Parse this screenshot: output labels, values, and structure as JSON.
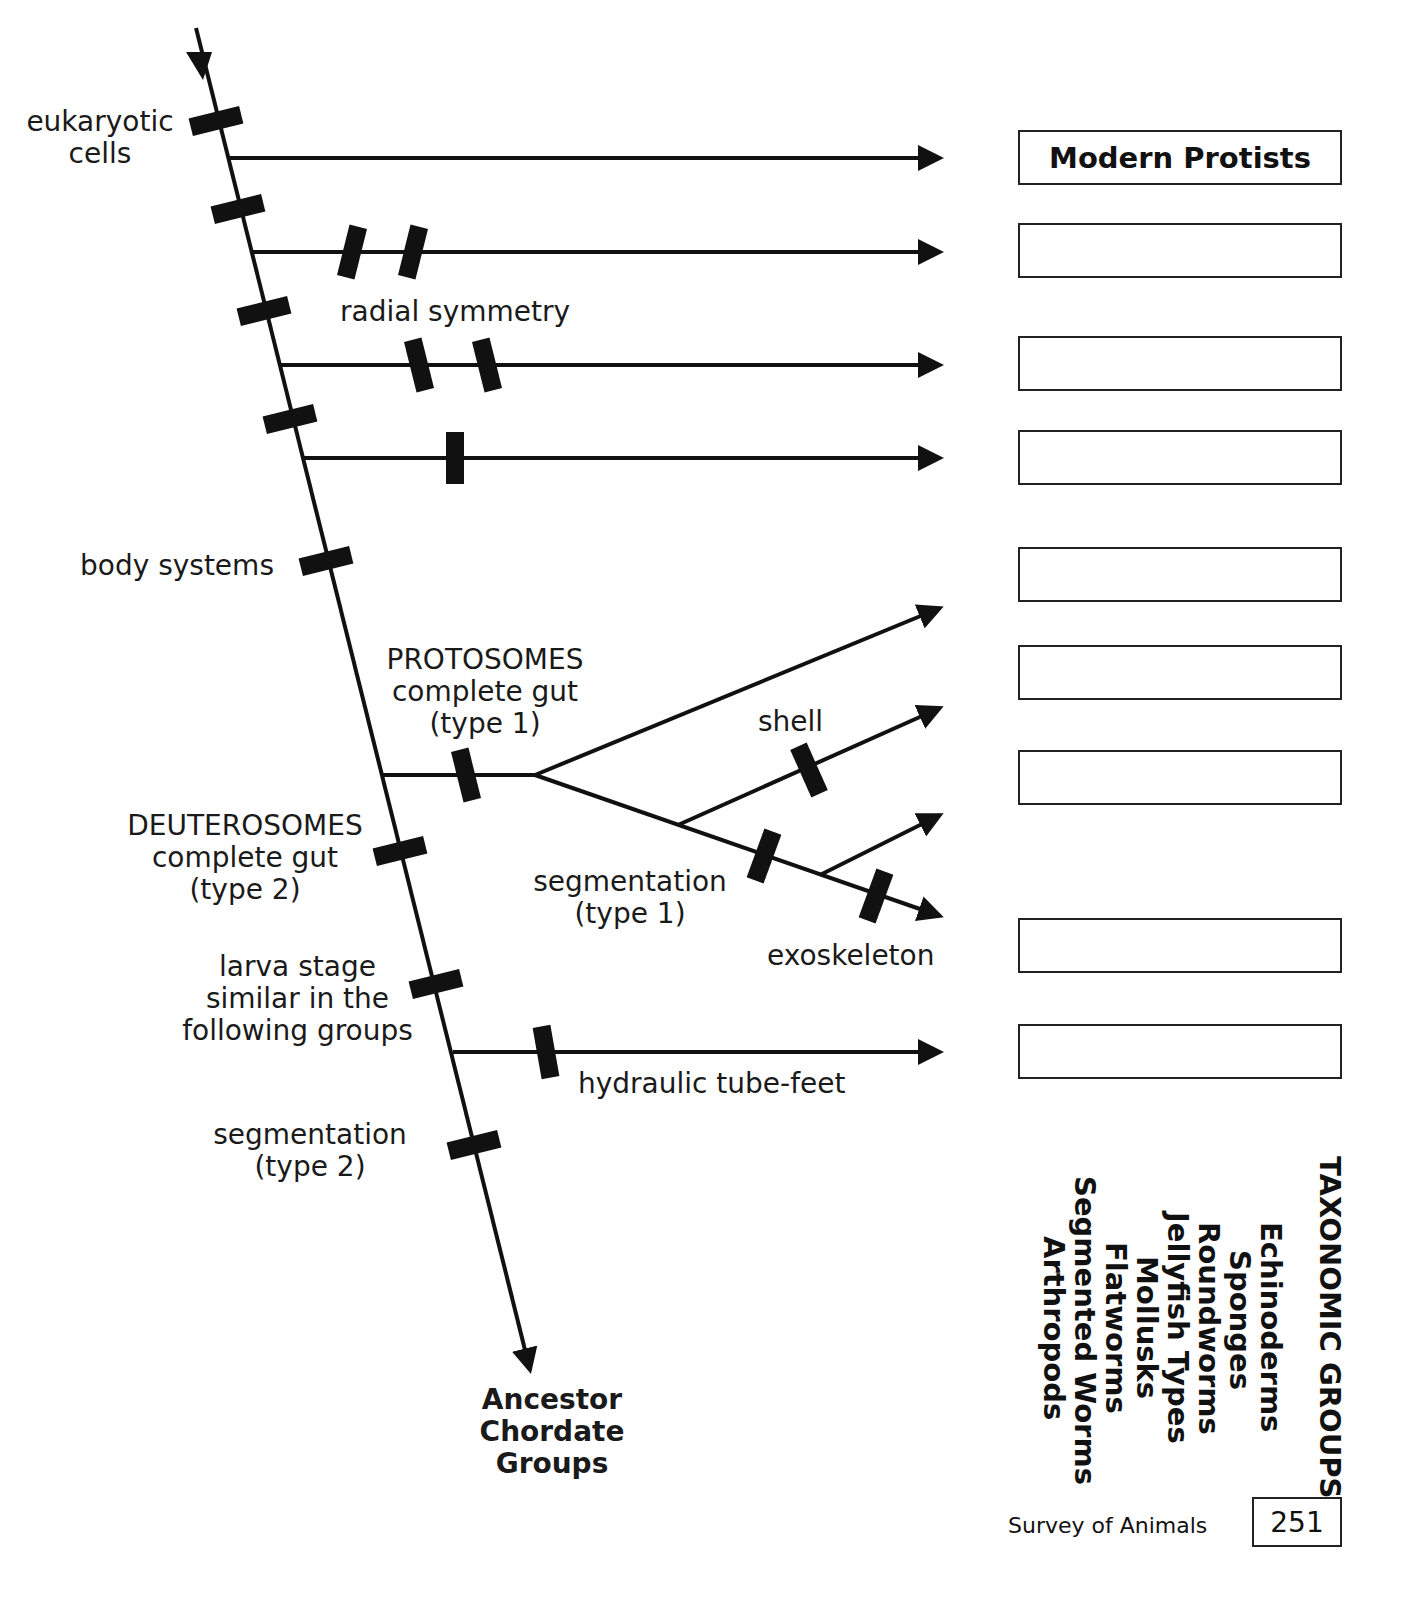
{
  "diagram": {
    "trunk_labels": {
      "eukaryotic": "eukaryotic\ncells",
      "body_systems": "body systems",
      "deuterosomes": "DEUTEROSOMES\ncomplete gut\n(type 2)",
      "larva": "larva stage\nsimilar in the\nfollowing groups",
      "segmentation2": "segmentation\n(type 2)"
    },
    "branch_labels": {
      "radial": "radial symmetry",
      "protosomes": "PROTOSOMES\ncomplete gut\n(type 1)",
      "shell": "shell",
      "segmentation1": "segmentation\n(type 1)",
      "exoskeleton": "exoskeleton",
      "tubefeet": "hydraulic tube-feet"
    },
    "ancestor": "Ancestor\nChordate\nGroups"
  },
  "answer_boxes": [
    {
      "label": "Modern Protists"
    },
    {
      "label": ""
    },
    {
      "label": ""
    },
    {
      "label": ""
    },
    {
      "label": ""
    },
    {
      "label": ""
    },
    {
      "label": ""
    },
    {
      "label": ""
    },
    {
      "label": ""
    }
  ],
  "taxonomic_groups": {
    "title": "TAXONOMIC GROUPS",
    "items": [
      "Echinoderms",
      "Sponges",
      "Roundworms",
      "Jellyfish Types",
      "Mollusks",
      "Flatworms",
      "Segmented Worms",
      "Arthropods"
    ]
  },
  "footer": {
    "book": "Survey of Animals",
    "page": "251"
  }
}
